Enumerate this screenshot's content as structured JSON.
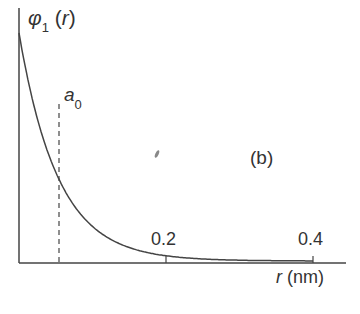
{
  "chart_data": {
    "type": "line",
    "title": "",
    "panel_label": "(b)",
    "ylabel": "φ1(r)",
    "xlabel": "r (nm)",
    "x_ticks": [
      0.2,
      0.4
    ],
    "xlim": [
      0,
      0.45
    ],
    "ylim": [
      0,
      1
    ],
    "grid": false,
    "legend": null,
    "annotations": [
      {
        "text": "a0",
        "x": 0.053,
        "style": "dashed vertical line"
      }
    ],
    "series": [
      {
        "name": "φ1(r)",
        "function": "exp(-r/a0)",
        "x": [
          0,
          0.025,
          0.053,
          0.075,
          0.1,
          0.15,
          0.2,
          0.25,
          0.3,
          0.35,
          0.4
        ],
        "values": [
          1.0,
          0.62,
          0.37,
          0.24,
          0.15,
          0.06,
          0.023,
          0.009,
          0.003,
          0.001,
          0.0005
        ]
      }
    ]
  },
  "labels": {
    "y_main": "φ",
    "y_sub": "1",
    "y_arg": "(r)",
    "a0_main": "a",
    "a0_sub": "0",
    "panel": "(b)",
    "tick_02": "0.2",
    "tick_04": "0.4",
    "x_var": "r",
    "x_unit": " (nm)"
  },
  "colors": {
    "axis": "#444444",
    "curve": "#444444",
    "text": "#333333"
  }
}
